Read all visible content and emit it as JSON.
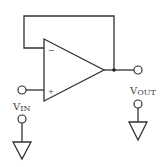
{
  "diagram": {
    "colors": {
      "stroke": "#333333",
      "background": "#ffffff"
    },
    "opamp": {
      "inverting_symbol": "−",
      "noninverting_symbol": "+"
    },
    "labels": {
      "input_main": "V",
      "input_sub": "IN",
      "output_main": "V",
      "output_sub": "OUT"
    },
    "components": [
      {
        "type": "op-amp",
        "role": "buffer"
      },
      {
        "type": "terminal",
        "name": "input"
      },
      {
        "type": "terminal",
        "name": "output"
      },
      {
        "type": "ground",
        "name": "input-ground"
      },
      {
        "type": "ground",
        "name": "output-ground"
      },
      {
        "type": "junction",
        "name": "output-node"
      }
    ]
  }
}
